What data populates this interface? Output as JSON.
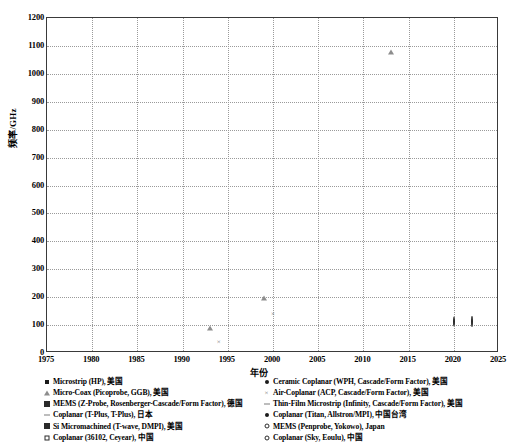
{
  "chart_data": {
    "type": "scatter",
    "title": "",
    "xlabel": "年份",
    "ylabel": "频率/GHz",
    "xlim": [
      1975,
      2025
    ],
    "ylim": [
      0,
      1200
    ],
    "xticks": [
      1975,
      1980,
      1985,
      1990,
      1995,
      2000,
      2005,
      2010,
      2015,
      2020,
      2025
    ],
    "yticks": [
      0,
      100,
      200,
      300,
      400,
      500,
      600,
      700,
      800,
      900,
      1000,
      1100,
      1200
    ],
    "grid": true,
    "legend_position": "below",
    "series": [
      {
        "name": "Microstrip (HP), 美国",
        "marker": "filled-square",
        "points": [
          {
            "x": 1977,
            "y": 12
          }
        ]
      },
      {
        "name": "Micro-Coax (Picoprobe, GGB), 美国",
        "marker": "open-triangle",
        "points": [
          {
            "x": 1993,
            "y": 110
          },
          {
            "x": 1999,
            "y": 220
          },
          {
            "x": 2013,
            "y": 1100
          }
        ]
      },
      {
        "name": "MEMS (Z-Probe, Rosenberger-Cascade/Form Factor), 德国",
        "marker": "hatched-square",
        "points": [
          {
            "x": 2011,
            "y": 325
          },
          {
            "x": 2012,
            "y": 500
          },
          {
            "x": 2012,
            "y": 1100
          },
          {
            "x": 2010,
            "y": 110
          },
          {
            "x": 2010,
            "y": 67
          }
        ]
      },
      {
        "name": "Coplanar (T-Plus, T-Plus), 日本",
        "marker": "dash",
        "points": [
          {
            "x": 2004,
            "y": 110
          },
          {
            "x": 2005,
            "y": 67
          },
          {
            "x": 2012,
            "y": 110
          }
        ]
      },
      {
        "name": "Si Micromachined (T-wave, DMPI), 美国",
        "marker": "hatched-square",
        "points": [
          {
            "x": 2002,
            "y": 67
          },
          {
            "x": 2009,
            "y": 110
          }
        ]
      },
      {
        "name": "Coplanar (36102, Ceyear), 中国",
        "marker": "open-square",
        "points": [
          {
            "x": 2022,
            "y": 110
          }
        ]
      },
      {
        "name": "Ceramic Coplanar (WPH, Cascade/Form Factor), 美国",
        "marker": "filled-circle",
        "points": [
          {
            "x": 1983,
            "y": 18
          },
          {
            "x": 1986,
            "y": 26
          },
          {
            "x": 1987,
            "y": 50
          },
          {
            "x": 1991,
            "y": 67
          },
          {
            "x": 2011,
            "y": 145
          },
          {
            "x": 2019,
            "y": 215
          }
        ]
      },
      {
        "name": "Air-Coplanar (ACP, Cascade/Form Factor), 美国",
        "marker": "x-cross",
        "points": [
          {
            "x": 1994,
            "y": 40
          },
          {
            "x": 2000,
            "y": 140
          }
        ]
      },
      {
        "name": "Thin-Film Microstrip (Infinity, Cascade/Form Factor), 美国",
        "marker": "dash",
        "points": [
          {
            "x": 2013,
            "y": 145
          },
          {
            "x": 1996,
            "y": 110
          }
        ]
      },
      {
        "name": "Coplanar (Titan, Allstron/MPI), 中国台湾",
        "marker": "filled-circle",
        "points": [
          {
            "x": 2013,
            "y": 110
          }
        ]
      },
      {
        "name": "MEMS (Penprobe, Yokowo), Japan",
        "marker": "open-circle",
        "points": [
          {
            "x": 2020,
            "y": 110
          }
        ]
      },
      {
        "name": "Coplanar (Sky, Eoulu), 中国",
        "marker": "open-circle",
        "points": [
          {
            "x": 2022,
            "y": 110
          }
        ]
      }
    ]
  },
  "axes": {
    "ylabel": "频率/GHz",
    "xlabel": "年份",
    "yticks": [
      "1200",
      "1100",
      "1000",
      "900",
      "800",
      "700",
      "600",
      "500",
      "400",
      "300",
      "200",
      "100",
      "0"
    ],
    "xticks": [
      "1975",
      "1980",
      "1985",
      "1990",
      "1995",
      "2000",
      "2005",
      "2010",
      "2015",
      "2020",
      "2025"
    ]
  },
  "legend": {
    "left_column": [
      {
        "marker": "filled-square",
        "label": "Microstrip (HP), 美国"
      },
      {
        "marker": "open-triangle",
        "label": "Micro-Coax (Picoprobe, GGB), 美国"
      },
      {
        "marker": "hatched-square",
        "label": "MEMS (Z-Probe, Rosenberger-Cascade/Form Factor), 德国"
      },
      {
        "marker": "dash",
        "label": "Coplanar (T-Plus, T-Plus), 日本"
      },
      {
        "marker": "hatched-square",
        "label": "Si Micromachined (T-wave, DMPI), 美国"
      },
      {
        "marker": "open-square",
        "label": "Coplanar (36102, Ceyear), 中国"
      }
    ],
    "right_column": [
      {
        "marker": "filled-circle",
        "label": "Ceramic Coplanar (WPH, Cascade/Form Factor), 美国"
      },
      {
        "marker": "x-cross",
        "label": "Air-Coplanar (ACP, Cascade/Form Factor), 美国"
      },
      {
        "marker": "dash",
        "label": "Thin-Film Microstrip (Infinity, Cascade/Form Factor), 美国"
      },
      {
        "marker": "filled-circle",
        "label": "Coplanar (Titan, Allstron/MPI), 中国台湾"
      },
      {
        "marker": "open-circle",
        "label": "MEMS (Penprobe, Yokowo), Japan"
      },
      {
        "marker": "open-circle",
        "label": "Coplanar (Sky, Eoulu), 中国"
      }
    ]
  },
  "colors": {
    "frame": "#3a3a3a",
    "grid": "#9a9a9a",
    "marker_dark": "#1b1b1b",
    "marker_gray": "#8d8d8d",
    "background": "#ffffff"
  }
}
